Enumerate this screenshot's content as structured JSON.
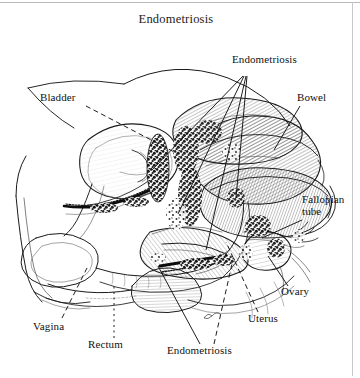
{
  "figure": {
    "title": "Endometriosis",
    "kind": "anatomical-line-drawing",
    "view": "midsagittal section of female pelvis",
    "style": "pen-and-ink cross-hatch engraving",
    "background_color": "#ffffff",
    "ink_color": "#111111",
    "border_color": "#b9b9b9"
  },
  "labels": [
    {
      "id": "bladder",
      "text": "Bladder",
      "x": 40,
      "y": 98,
      "leader": "dashed",
      "leader_to": [
        [
          86,
          108
        ],
        [
          170,
          152
        ]
      ]
    },
    {
      "id": "endometriosis-top",
      "text": "Endometriosis",
      "x": 232,
      "y": 60,
      "leader": "solid-fan",
      "leader_to": [
        [
          244,
          74,
          150,
          168
        ],
        [
          244,
          74,
          176,
          213
        ],
        [
          244,
          74,
          206,
          248
        ],
        [
          244,
          74,
          236,
          196
        ]
      ]
    },
    {
      "id": "bowel",
      "text": "Bowel",
      "x": 298,
      "y": 98,
      "leader": "solid",
      "leader_to": [
        [
          300,
          108
        ],
        [
          276,
          148
        ]
      ]
    },
    {
      "id": "fallopian-tube",
      "text": "Fallopian\ntube",
      "line1": "Fallopian",
      "line2": "tube",
      "x": 303,
      "y": 200,
      "leader": "solid",
      "leader_to": [
        [
          304,
          222
        ],
        [
          264,
          238
        ]
      ]
    },
    {
      "id": "ovary",
      "text": "Ovary",
      "x": 281,
      "y": 291,
      "leader": "solid",
      "leader_to": [
        [
          288,
          288
        ],
        [
          268,
          258
        ]
      ]
    },
    {
      "id": "uterus",
      "text": "Uterus",
      "x": 248,
      "y": 318,
      "leader": "dashed",
      "leader_to": [
        [
          256,
          314
        ],
        [
          228,
          244
        ]
      ]
    },
    {
      "id": "endometriosis-bottom",
      "text": "Endometriosis",
      "x": 168,
      "y": 348,
      "leader": "solid-fan",
      "leader_to": [
        [
          200,
          344,
          158,
          268
        ],
        [
          212,
          344,
          231,
          266
        ]
      ]
    },
    {
      "id": "rectum",
      "text": "Rectum",
      "x": 88,
      "y": 343,
      "leader": "dotted",
      "leader_to": [
        [
          114,
          338
        ],
        [
          114,
          288
        ]
      ]
    },
    {
      "id": "vagina",
      "text": "Vagina",
      "x": 33,
      "y": 325,
      "leader": "dashed",
      "leader_to": [
        [
          62,
          320
        ],
        [
          86,
          268
        ]
      ]
    }
  ],
  "anatomy_parts": [
    "bladder",
    "bowel",
    "uterus",
    "ovary",
    "fallopian tube",
    "rectum",
    "vagina",
    "endometriosis lesions"
  ]
}
